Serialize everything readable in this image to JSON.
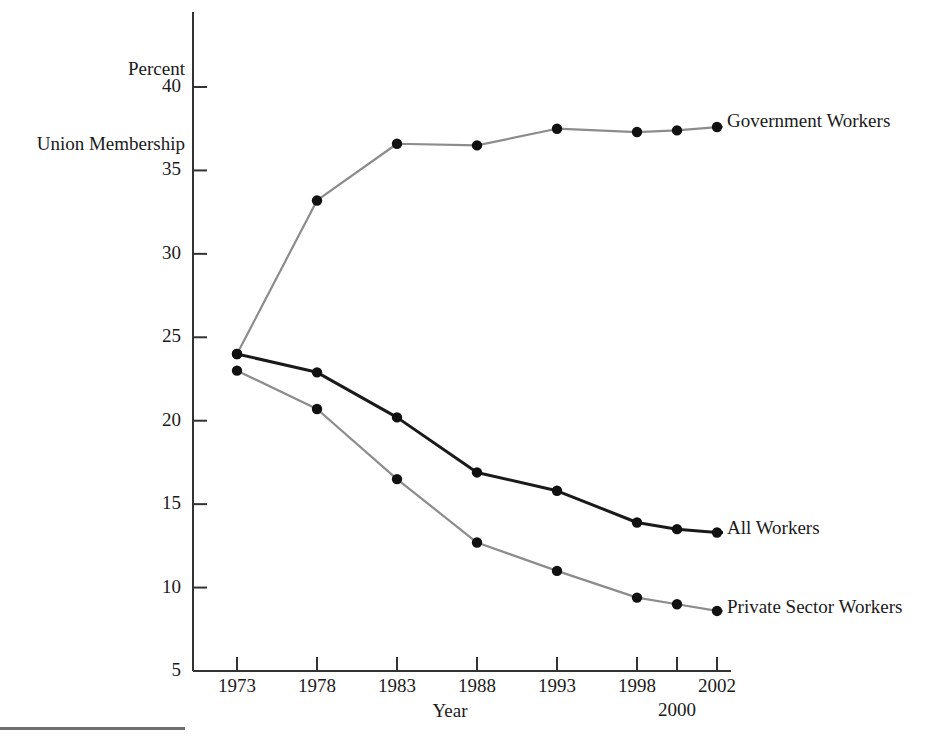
{
  "chart_data": {
    "type": "line",
    "title": "",
    "ylabel_line1": "Percent",
    "ylabel_line2": "Union Membership",
    "xlabel": "Year",
    "categories": [
      1973,
      1978,
      1983,
      1988,
      1993,
      1998,
      2000,
      2002
    ],
    "xtick_labels": [
      "1973",
      "1978",
      "1983",
      "1988",
      "1993",
      "1998",
      "2000",
      "2002"
    ],
    "ytick_labels": [
      "40",
      "35",
      "30",
      "25",
      "20",
      "15",
      "10",
      "5"
    ],
    "yticks": [
      40,
      35,
      30,
      25,
      20,
      15,
      10,
      5
    ],
    "ylim": [
      5,
      40
    ],
    "xlim": [
      1973,
      2002
    ],
    "grid": false,
    "legend_position": "right-inline-end-of-line",
    "series": [
      {
        "name": "Government Workers",
        "color": "#8c8c8c",
        "marker_color": "#111111",
        "values": [
          24.0,
          33.2,
          36.6,
          36.5,
          37.5,
          37.3,
          37.4,
          37.6
        ]
      },
      {
        "name": "All Workers",
        "color": "#1a1a1a",
        "marker_color": "#111111",
        "values": [
          24.0,
          22.9,
          20.2,
          16.9,
          15.8,
          13.9,
          13.5,
          13.3
        ]
      },
      {
        "name": "Private Sector Workers",
        "color": "#8c8c8c",
        "marker_color": "#111111",
        "values": [
          23.0,
          20.7,
          16.5,
          12.7,
          11.0,
          9.4,
          9.0,
          8.6
        ]
      }
    ]
  },
  "axis": {
    "line_color": "#333333"
  },
  "series_labels": {
    "government": "Government Workers",
    "all": "All Workers",
    "private": "Private Sector Workers"
  }
}
